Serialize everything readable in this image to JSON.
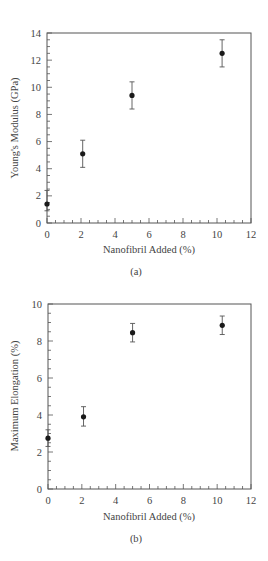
{
  "chart_data": [
    {
      "type": "scatter",
      "title": "",
      "caption": "(a)",
      "xlabel": "Nanofibril Added (%)",
      "ylabel": "Young's Modulus (GPa)",
      "xlim": [
        0,
        12
      ],
      "ylim": [
        0,
        14
      ],
      "xticks": [
        0,
        2,
        4,
        6,
        8,
        10,
        12
      ],
      "yticks": [
        0,
        2,
        4,
        6,
        8,
        10,
        12,
        14
      ],
      "x_minor_step": 0.5,
      "y_minor_step": 0.5,
      "grid": false,
      "legend": null,
      "series": [
        {
          "name": "Young's Modulus",
          "x": [
            0,
            2.1,
            5.0,
            10.3
          ],
          "y": [
            1.4,
            5.1,
            9.4,
            12.5
          ],
          "error_low": [
            0.9,
            4.1,
            8.4,
            11.5
          ],
          "error_high": [
            2.4,
            6.1,
            10.4,
            13.5
          ]
        }
      ]
    },
    {
      "type": "scatter",
      "title": "",
      "caption": "(b)",
      "xlabel": "Nanofibril Added (%)",
      "ylabel": "Maximum Elongation (%)",
      "xlim": [
        0,
        12
      ],
      "ylim": [
        0,
        10
      ],
      "xticks": [
        0,
        2,
        4,
        6,
        8,
        10,
        12
      ],
      "yticks": [
        0,
        2,
        4,
        6,
        8,
        10
      ],
      "x_minor_step": 0.5,
      "y_minor_step": 0.5,
      "grid": false,
      "legend": null,
      "series": [
        {
          "name": "Maximum Elongation",
          "x": [
            0,
            2.1,
            5.0,
            10.3
          ],
          "y": [
            2.75,
            3.9,
            8.45,
            8.85
          ],
          "error_low": [
            2.3,
            3.4,
            7.95,
            8.35
          ],
          "error_high": [
            3.2,
            4.45,
            8.95,
            9.35
          ]
        }
      ]
    }
  ],
  "panels": {
    "a": {
      "caption": "(a)",
      "xlabel": "Nanofibril Added (%)",
      "ylabel": "Young's Modulus (GPa)"
    },
    "b": {
      "caption": "(b)",
      "xlabel": "Nanofibril Added (%)",
      "ylabel": "Maximum Elongation (%)"
    }
  },
  "colors": {
    "frame": "#555555",
    "marker": "#1a1a1a",
    "errorbar": "#555555",
    "text": "#444444"
  }
}
